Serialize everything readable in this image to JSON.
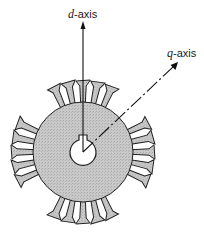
{
  "diagram": {
    "type": "rotor cross-section with d-q axes",
    "labels": {
      "d_axis_symbol": "d",
      "d_axis_suffix": "-axis",
      "q_axis_symbol": "q",
      "q_axis_suffix": "-axis"
    },
    "rotor": {
      "center": [
        83,
        152
      ],
      "radius": 50,
      "fill": "#c8c8c8",
      "shaft_radius": 13,
      "teeth_groups": [
        {
          "position": "top",
          "angle_deg": -90,
          "count": 5
        },
        {
          "position": "right",
          "angle_deg": 0,
          "count": 5
        },
        {
          "position": "bottom",
          "angle_deg": 90,
          "count": 5
        },
        {
          "position": "left",
          "angle_deg": 180,
          "count": 5
        }
      ]
    },
    "axes": [
      {
        "name": "d-axis",
        "style": "solid",
        "direction": "vertical-up"
      },
      {
        "name": "q-axis",
        "style": "dash-dot",
        "direction": "diagonal-up-right"
      }
    ]
  }
}
